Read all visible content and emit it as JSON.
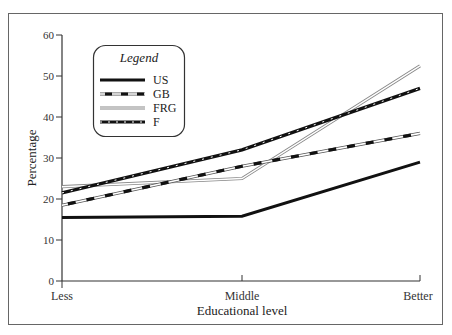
{
  "chart_data": {
    "type": "line",
    "title": "",
    "xlabel": "Educational level",
    "ylabel": "Percentage",
    "categories": [
      "Less",
      "Middle",
      "Better"
    ],
    "ylim": [
      0,
      60
    ],
    "yticks": [
      0,
      10,
      20,
      30,
      40,
      50,
      60
    ],
    "grid": false,
    "legend_position": "upper left (inset, rounded box)",
    "legend_title": "Legend",
    "series": [
      {
        "name": "US",
        "style": "solid-thick-black",
        "values": [
          15.5,
          15.8,
          29
        ]
      },
      {
        "name": "GB",
        "style": "dashed-black-on-white-double",
        "values": [
          18.5,
          28,
          36
        ]
      },
      {
        "name": "FRG",
        "style": "double-thin-gray",
        "values": [
          23,
          25,
          52.5
        ]
      },
      {
        "name": "F",
        "style": "dashed-black-thick",
        "values": [
          21.5,
          32,
          47
        ]
      }
    ]
  },
  "labels": {
    "legend_title": "Legend",
    "xlabel": "Educational level",
    "ylabel": "Percentage",
    "x0": "Less",
    "x1": "Middle",
    "x2": "Better",
    "y0": "0",
    "y10": "10",
    "y20": "20",
    "y30": "30",
    "y40": "40",
    "y50": "50",
    "y60": "60",
    "s_us": "US",
    "s_gb": "GB",
    "s_frg": "FRG",
    "s_f": "F"
  },
  "colors": {
    "line": "#111111",
    "frg": "#888888",
    "frame": "#555555"
  }
}
